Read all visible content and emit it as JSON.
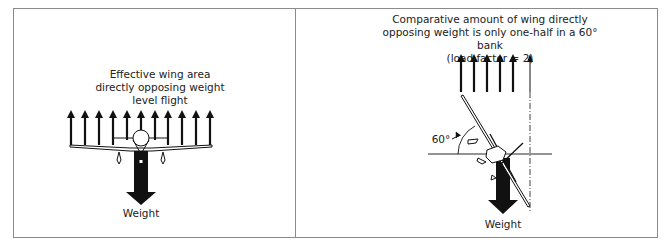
{
  "left_panel": {
    "caption_lines": [
      "Effective wing area",
      "directly opposing weight",
      "level flight"
    ],
    "weight_label": "Weight",
    "lift_arrow_count": 11
  },
  "right_panel": {
    "caption_lines": [
      "Comparative amount of wing directly",
      "opposing weight is only one-half in a 60° bank",
      "(load factor = 2)"
    ],
    "angle_label": "60°",
    "weight_label": "Weight",
    "lift_arrow_count": 6
  }
}
